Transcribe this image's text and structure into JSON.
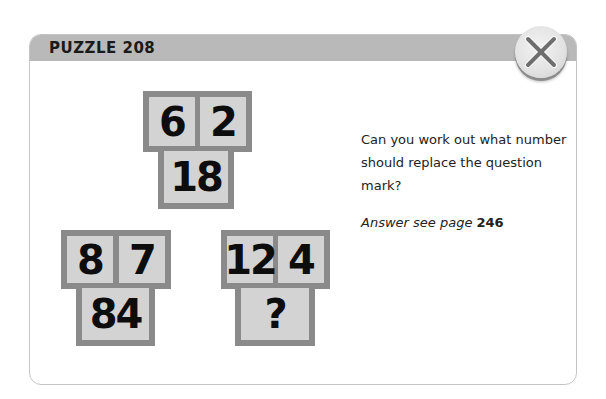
{
  "header": {
    "title": "PUZZLE 208"
  },
  "close_button": {
    "icon": "close-icon"
  },
  "puzzle": {
    "groups": [
      {
        "top_left": "6",
        "top_right": "2",
        "bottom": "18"
      },
      {
        "top_left": "8",
        "top_right": "7",
        "bottom": "84"
      },
      {
        "top_left": "12",
        "top_right": "4",
        "bottom": "?"
      }
    ]
  },
  "text": {
    "question": "Can you work out what number should replace the question mark?",
    "answer_prefix": "Answer see page",
    "answer_page": "246"
  },
  "colors": {
    "header_bg": "#b9b9b9",
    "tile_border": "#8a8a8a",
    "tile_fill": "#d3d3d3"
  }
}
